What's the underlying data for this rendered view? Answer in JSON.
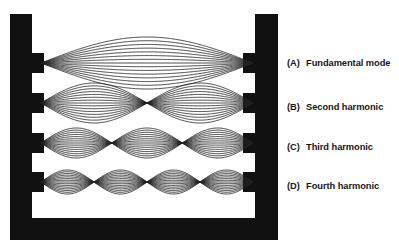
{
  "figure": {
    "title_cut_off_fragment": "",
    "frame": {
      "color": "#111111",
      "description": "two vertical black posts joined by a bottom bar, each post has four rectangular tabs that clamp the ends of the vibrating strings"
    },
    "string_color": "#222222",
    "background": "#ffffff",
    "post_count": 2,
    "tab_count_per_post": 4
  },
  "modes": [
    {
      "tag": "(A)",
      "label": "Fundamental mode",
      "loops": 1,
      "harmonic_number": 1,
      "nodes": 2,
      "antinodes": 1,
      "y": 63,
      "amplitude": 26
    },
    {
      "tag": "(B)",
      "label": "Second harmonic",
      "loops": 2,
      "harmonic_number": 2,
      "nodes": 3,
      "antinodes": 2,
      "y": 103,
      "amplitude": 20
    },
    {
      "tag": "(C)",
      "label": "Third harmonic",
      "loops": 3,
      "harmonic_number": 3,
      "nodes": 4,
      "antinodes": 3,
      "y": 143,
      "amplitude": 15
    },
    {
      "tag": "(D)",
      "label": "Fourth harmonic",
      "loops": 4,
      "harmonic_number": 4,
      "nodes": 5,
      "antinodes": 4,
      "y": 182,
      "amplitude": 12
    }
  ],
  "geometry": {
    "string_left_x": 41,
    "string_right_x": 253,
    "left_post_x": 10,
    "left_post_width": 22,
    "right_post_x": 255,
    "right_post_width": 23,
    "post_top_y": 14,
    "bottom_bar_y": 218,
    "bottom_bar_height": 22,
    "tab_width": 12,
    "tab_height": 20,
    "envelope_line_count": 7
  }
}
